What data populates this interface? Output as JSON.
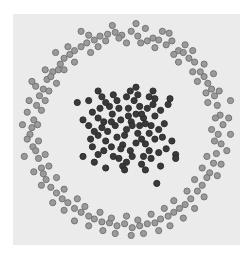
{
  "chart_data": {
    "type": "scatter",
    "title": "",
    "xlabel": "",
    "ylabel": "",
    "xlim": [
      -1.2,
      1.2
    ],
    "ylim": [
      -1.2,
      1.2
    ],
    "grid": false,
    "legend": null,
    "plot_area_px": {
      "x": 13,
      "y": 14,
      "width": 227,
      "height": 231
    },
    "background_color": "#ebebeb",
    "series": [
      {
        "name": "outer ring",
        "fill": "#9a9a9a",
        "stroke": "#6f6f6f",
        "radius_px": 3.1,
        "points": [
          [
            -0.98,
            0.1
          ],
          [
            -1.02,
            -0.05
          ],
          [
            -0.95,
            0.25
          ],
          [
            -0.92,
            0.35
          ],
          [
            -1.05,
            0.18
          ],
          [
            -0.88,
            0.42
          ],
          [
            -0.99,
            -0.18
          ],
          [
            -0.93,
            -0.3
          ],
          [
            -0.9,
            -0.4
          ],
          [
            -1.03,
            0.3
          ],
          [
            -0.84,
            0.52
          ],
          [
            -0.78,
            0.6
          ],
          [
            -0.8,
            0.55
          ],
          [
            -0.7,
            0.68
          ],
          [
            -0.66,
            0.74
          ],
          [
            -0.6,
            0.78
          ],
          [
            -0.72,
            0.62
          ],
          [
            -0.55,
            0.82
          ],
          [
            -0.48,
            0.86
          ],
          [
            -0.42,
            0.9
          ],
          [
            -0.34,
            0.93
          ],
          [
            -0.28,
            0.97
          ],
          [
            -0.2,
            0.99
          ],
          [
            -0.12,
            1.01
          ],
          [
            -0.05,
            0.98
          ],
          [
            0.05,
            1.02
          ],
          [
            0.12,
            0.97
          ],
          [
            0.2,
            1.05
          ],
          [
            0.28,
            0.95
          ],
          [
            0.34,
            0.93
          ],
          [
            0.42,
            0.88
          ],
          [
            0.48,
            0.92
          ],
          [
            0.55,
            0.82
          ],
          [
            0.6,
            0.8
          ],
          [
            0.66,
            0.74
          ],
          [
            0.72,
            0.7
          ],
          [
            0.78,
            0.6
          ],
          [
            0.82,
            0.55
          ],
          [
            0.86,
            0.48
          ],
          [
            0.9,
            0.42
          ],
          [
            0.93,
            0.35
          ],
          [
            0.96,
            0.25
          ],
          [
            0.99,
            0.15
          ],
          [
            1.02,
            0.05
          ],
          [
            0.97,
            -0.05
          ],
          [
            1.0,
            -0.15
          ],
          [
            0.95,
            -0.25
          ],
          [
            0.92,
            -0.35
          ],
          [
            0.88,
            -0.45
          ],
          [
            0.85,
            -0.5
          ],
          [
            0.8,
            -0.58
          ],
          [
            0.75,
            -0.64
          ],
          [
            0.68,
            -0.72
          ],
          [
            0.62,
            -0.78
          ],
          [
            0.56,
            -0.82
          ],
          [
            0.5,
            -0.86
          ],
          [
            0.44,
            -0.9
          ],
          [
            0.36,
            -0.93
          ],
          [
            0.3,
            -0.97
          ],
          [
            0.22,
            -0.98
          ],
          [
            0.14,
            -1.0
          ],
          [
            0.06,
            -1.02
          ],
          [
            -0.02,
            -0.98
          ],
          [
            -0.1,
            -1.0
          ],
          [
            -0.18,
            -0.97
          ],
          [
            -0.26,
            -0.96
          ],
          [
            -0.34,
            -0.93
          ],
          [
            -0.4,
            -0.9
          ],
          [
            -0.48,
            -0.86
          ],
          [
            -0.55,
            -0.82
          ],
          [
            -0.62,
            -0.76
          ],
          [
            -0.68,
            -0.72
          ],
          [
            -0.74,
            -0.66
          ],
          [
            -0.8,
            -0.6
          ],
          [
            -0.85,
            -0.52
          ],
          [
            -0.88,
            -0.46
          ],
          [
            -0.96,
            -0.22
          ],
          [
            -1.05,
            -0.1
          ],
          [
            -1.0,
            0.02
          ],
          [
            -0.96,
            0.45
          ],
          [
            -0.86,
            0.62
          ],
          [
            -0.62,
            0.86
          ],
          [
            -0.4,
            0.98
          ],
          [
            -0.15,
            1.08
          ],
          [
            0.1,
            1.1
          ],
          [
            0.38,
            1.02
          ],
          [
            0.62,
            0.88
          ],
          [
            0.82,
            0.68
          ],
          [
            0.98,
            0.4
          ],
          [
            1.08,
            0.12
          ],
          [
            1.06,
            -0.22
          ],
          [
            0.96,
            -0.48
          ],
          [
            0.72,
            -0.82
          ],
          [
            0.46,
            -1.0
          ],
          [
            0.18,
            -1.08
          ],
          [
            -0.12,
            -1.08
          ],
          [
            -0.4,
            -1.0
          ],
          [
            -0.66,
            -0.84
          ],
          [
            -0.9,
            -0.58
          ],
          [
            -1.08,
            -0.28
          ],
          [
            -0.9,
            0.2
          ],
          [
            -0.86,
            0.3
          ],
          [
            -0.74,
            0.48
          ],
          [
            -0.55,
            0.7
          ],
          [
            -0.3,
            0.86
          ],
          [
            0.0,
            0.9
          ],
          [
            0.3,
            0.85
          ],
          [
            0.55,
            0.7
          ],
          [
            0.75,
            0.5
          ],
          [
            0.86,
            0.28
          ],
          [
            0.9,
            0.0
          ],
          [
            0.85,
            -0.28
          ],
          [
            0.72,
            -0.52
          ],
          [
            0.5,
            -0.74
          ],
          [
            0.26,
            -0.88
          ],
          [
            0.0,
            -0.9
          ],
          [
            -0.28,
            -0.86
          ],
          [
            -0.52,
            -0.72
          ],
          [
            -0.74,
            -0.5
          ],
          [
            -0.86,
            -0.26
          ],
          [
            -1.1,
            0.05
          ],
          [
            -1.0,
            0.5
          ],
          [
            -0.75,
            0.8
          ],
          [
            -0.48,
            1.02
          ],
          [
            -0.22,
            0.92
          ],
          [
            0.15,
            0.9
          ],
          [
            0.45,
            1.0
          ],
          [
            0.7,
            0.82
          ],
          [
            0.92,
            0.58
          ],
          [
            1.1,
            0.3
          ],
          [
            1.1,
            -0.05
          ],
          [
            1.0,
            -0.36
          ],
          [
            0.82,
            -0.7
          ],
          [
            0.6,
            -0.92
          ],
          [
            0.34,
            -1.05
          ],
          [
            0.05,
            -1.1
          ],
          [
            -0.25,
            -1.05
          ],
          [
            -0.55,
            -0.95
          ],
          [
            -0.78,
            -0.76
          ],
          [
            -0.98,
            -0.44
          ],
          [
            -0.94,
            0.05
          ],
          [
            -0.82,
            0.4
          ],
          [
            -0.66,
            0.62
          ],
          [
            -0.38,
            0.8
          ],
          [
            -0.08,
            0.95
          ],
          [
            0.22,
            0.92
          ],
          [
            0.5,
            0.78
          ],
          [
            0.7,
            0.6
          ],
          [
            0.84,
            0.38
          ],
          [
            0.94,
            0.12
          ],
          [
            0.93,
            -0.12
          ],
          [
            0.8,
            -0.4
          ],
          [
            0.64,
            -0.64
          ],
          [
            0.4,
            -0.82
          ],
          [
            0.12,
            -0.94
          ],
          [
            -0.16,
            -0.92
          ],
          [
            -0.44,
            -0.8
          ],
          [
            -0.66,
            -0.62
          ],
          [
            -0.82,
            -0.38
          ],
          [
            -0.93,
            -0.12
          ]
        ]
      },
      {
        "name": "inner cluster",
        "fill": "#3a3a3a",
        "stroke": "#2a2a2a",
        "radius_px": 3.1,
        "points": [
          [
            0.0,
            0.0
          ],
          [
            0.05,
            0.08
          ],
          [
            -0.06,
            0.1
          ],
          [
            0.12,
            -0.04
          ],
          [
            -0.1,
            -0.08
          ],
          [
            0.18,
            0.12
          ],
          [
            -0.15,
            0.16
          ],
          [
            0.2,
            -0.15
          ],
          [
            -0.22,
            -0.12
          ],
          [
            0.02,
            0.22
          ],
          [
            0.04,
            -0.22
          ],
          [
            0.26,
            0.04
          ],
          [
            -0.26,
            0.02
          ],
          [
            0.14,
            0.24
          ],
          [
            -0.18,
            0.24
          ],
          [
            0.24,
            -0.22
          ],
          [
            -0.24,
            -0.22
          ],
          [
            0.08,
            0.3
          ],
          [
            -0.08,
            -0.3
          ],
          [
            0.3,
            0.14
          ],
          [
            -0.3,
            0.12
          ],
          [
            0.3,
            -0.1
          ],
          [
            -0.3,
            -0.06
          ],
          [
            0.1,
            0.16
          ],
          [
            -0.12,
            0.04
          ],
          [
            0.16,
            -0.1
          ],
          [
            -0.04,
            -0.16
          ],
          [
            0.22,
            0.22
          ],
          [
            -0.22,
            0.28
          ],
          [
            0.18,
            -0.28
          ],
          [
            -0.14,
            -0.28
          ],
          [
            0.34,
            0.0
          ],
          [
            -0.34,
            -0.02
          ],
          [
            0.0,
            0.34
          ],
          [
            0.0,
            -0.34
          ],
          [
            0.28,
            0.26
          ],
          [
            -0.28,
            0.22
          ],
          [
            0.26,
            -0.3
          ],
          [
            -0.3,
            -0.26
          ],
          [
            0.06,
            0.04
          ],
          [
            -0.02,
            -0.06
          ],
          [
            0.1,
            -0.14
          ],
          [
            -0.16,
            0.08
          ],
          [
            0.14,
            0.04
          ],
          [
            -0.08,
            0.22
          ],
          [
            0.2,
            0.06
          ],
          [
            -0.2,
            -0.02
          ],
          [
            0.06,
            -0.28
          ],
          [
            -0.1,
            0.3
          ],
          [
            0.36,
            0.2
          ],
          [
            -0.36,
            0.18
          ],
          [
            0.34,
            -0.24
          ],
          [
            -0.36,
            -0.18
          ],
          [
            0.12,
            0.36
          ],
          [
            -0.14,
            0.36
          ],
          [
            0.16,
            -0.36
          ],
          [
            -0.04,
            -0.38
          ],
          [
            0.4,
            0.06
          ],
          [
            -0.4,
            0.04
          ],
          [
            0.24,
            0.34
          ],
          [
            -0.26,
            0.34
          ],
          [
            0.3,
            0.32
          ],
          [
            0.38,
            -0.08
          ],
          [
            -0.38,
            -0.1
          ],
          [
            0.02,
            0.14
          ],
          [
            -0.06,
            -0.2
          ],
          [
            0.16,
            0.16
          ],
          [
            -0.16,
            -0.18
          ],
          [
            0.24,
            -0.04
          ],
          [
            -0.24,
            0.08
          ],
          [
            0.04,
            0.4
          ],
          [
            -0.02,
            -0.42
          ],
          [
            0.42,
            -0.2
          ],
          [
            -0.4,
            0.3
          ],
          [
            0.44,
            0.26
          ],
          [
            0.2,
            -0.42
          ],
          [
            -0.22,
            -0.4
          ],
          [
            0.36,
            -0.38
          ],
          [
            -0.34,
            -0.34
          ],
          [
            0.48,
            -0.12
          ],
          [
            -0.46,
            0.1
          ],
          [
            0.1,
            0.44
          ],
          [
            0.28,
            0.4
          ],
          [
            -0.3,
            0.4
          ],
          [
            0.46,
            0.32
          ],
          [
            0.52,
            -0.26
          ],
          [
            0.52,
            -0.3
          ],
          [
            -0.46,
            -0.28
          ],
          [
            0.32,
            -0.56
          ],
          [
            -0.52,
            0.28
          ]
        ]
      }
    ]
  }
}
